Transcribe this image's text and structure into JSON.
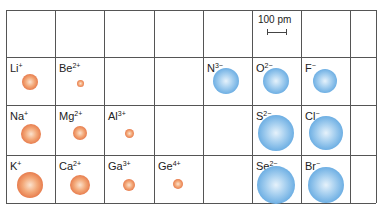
{
  "scale": {
    "label": "100 pm",
    "bar_px": 19
  },
  "grid": {
    "x_lines": [
      6,
      55,
      104,
      154,
      203,
      252,
      301,
      350,
      376
    ],
    "y_lines": [
      10,
      57,
      105,
      155,
      203
    ],
    "line_color": "#555555"
  },
  "colors": {
    "cation": "#e2693a",
    "anion": "#5ea6e0"
  },
  "ions": [
    {
      "symbol": "Li",
      "charge": "+",
      "type": "cation",
      "row": 1,
      "col": 0,
      "cx": 30,
      "cy": 82,
      "r": 8
    },
    {
      "symbol": "Be",
      "charge": "2+",
      "type": "cation",
      "row": 1,
      "col": 1,
      "cx": 80,
      "cy": 83,
      "r": 3.5
    },
    {
      "symbol": "N",
      "charge": "3−",
      "type": "anion",
      "row": 1,
      "col": 4,
      "cx": 226,
      "cy": 81,
      "r": 13
    },
    {
      "symbol": "O",
      "charge": "2−",
      "type": "anion",
      "row": 1,
      "col": 5,
      "cx": 276,
      "cy": 81,
      "r": 13
    },
    {
      "symbol": "F",
      "charge": "−",
      "type": "anion",
      "row": 1,
      "col": 6,
      "cx": 325,
      "cy": 81,
      "r": 12
    },
    {
      "symbol": "Na",
      "charge": "+",
      "type": "cation",
      "row": 2,
      "col": 0,
      "cx": 31,
      "cy": 134,
      "r": 10
    },
    {
      "symbol": "Mg",
      "charge": "2+",
      "type": "cation",
      "row": 2,
      "col": 1,
      "cx": 80,
      "cy": 133,
      "r": 7
    },
    {
      "symbol": "Al",
      "charge": "3+",
      "type": "cation",
      "row": 2,
      "col": 2,
      "cx": 129,
      "cy": 133,
      "r": 4.5
    },
    {
      "symbol": "S",
      "charge": "2−",
      "type": "anion",
      "row": 2,
      "col": 5,
      "cx": 276,
      "cy": 133,
      "r": 18
    },
    {
      "symbol": "Cl",
      "charge": "−",
      "type": "anion",
      "row": 2,
      "col": 6,
      "cx": 326,
      "cy": 133,
      "r": 17
    },
    {
      "symbol": "K",
      "charge": "+",
      "type": "cation",
      "row": 3,
      "col": 0,
      "cx": 30,
      "cy": 185,
      "r": 13
    },
    {
      "symbol": "Ca",
      "charge": "2+",
      "type": "cation",
      "row": 3,
      "col": 1,
      "cx": 80,
      "cy": 185,
      "r": 10
    },
    {
      "symbol": "Ga",
      "charge": "3+",
      "type": "cation",
      "row": 3,
      "col": 2,
      "cx": 129,
      "cy": 185,
      "r": 6
    },
    {
      "symbol": "Ge",
      "charge": "4+",
      "type": "cation",
      "row": 3,
      "col": 3,
      "cx": 178,
      "cy": 184,
      "r": 5
    },
    {
      "symbol": "Se",
      "charge": "2−",
      "type": "anion",
      "row": 3,
      "col": 5,
      "cx": 276,
      "cy": 185,
      "r": 19
    },
    {
      "symbol": "Br",
      "charge": "−",
      "type": "anion",
      "row": 3,
      "col": 6,
      "cx": 326,
      "cy": 185,
      "r": 18
    }
  ]
}
